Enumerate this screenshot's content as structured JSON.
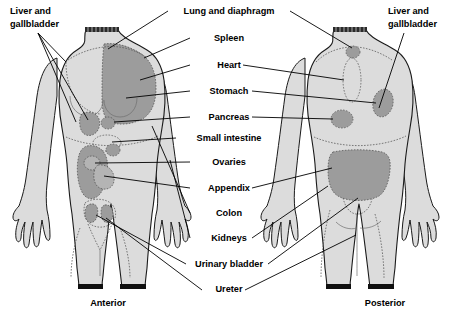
{
  "diagram": {
    "colors": {
      "body_fill": "#dcdcdc",
      "organ_dark": "#9c9c9c",
      "organ_mid": "#b4b4b4",
      "outline": "#1a1a1a",
      "background": "#ffffff",
      "band": "#101010"
    },
    "captions": {
      "anterior": "Anterior",
      "posterior": "Posterior"
    },
    "side_labels": {
      "left": {
        "line1": "Liver and",
        "line2": "gallbladder"
      },
      "right": {
        "line1": "Liver and",
        "line2": "gallbladder"
      }
    },
    "center_labels": [
      {
        "id": "lung-and-diaphragm",
        "text": "Lung and diaphragm",
        "y": 14
      },
      {
        "id": "spleen",
        "text": "Spleen",
        "y": 41
      },
      {
        "id": "heart",
        "text": "Heart",
        "y": 68
      },
      {
        "id": "stomach",
        "text": "Stomach",
        "y": 94
      },
      {
        "id": "pancreas",
        "text": "Pancreas",
        "y": 120
      },
      {
        "id": "small-intestine",
        "text": "Small intestine",
        "y": 141
      },
      {
        "id": "ovaries",
        "text": "Ovaries",
        "y": 165
      },
      {
        "id": "appendix",
        "text": "Appendix",
        "y": 191
      },
      {
        "id": "colon",
        "text": "Colon",
        "y": 216
      },
      {
        "id": "kidneys",
        "text": "Kidneys",
        "y": 241
      },
      {
        "id": "urinary-bladder",
        "text": "Urinary bladder",
        "y": 267
      },
      {
        "id": "ureter",
        "text": "Ureter",
        "y": 292
      }
    ]
  }
}
